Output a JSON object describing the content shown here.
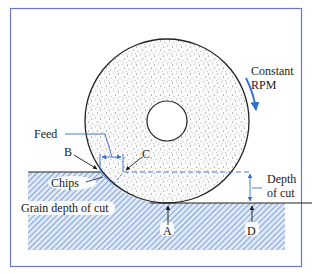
{
  "diagram": {
    "type": "grinding-process-schematic",
    "labels": {
      "rotation": "Constant",
      "rotation_line2": "RPM",
      "feed": "Feed",
      "point_b": "B",
      "point_c": "C",
      "chips": "Chips",
      "depth_of_cut": "Depth",
      "depth_of_cut_line2": "of cut",
      "grain_depth": "Grain depth of cut",
      "point_a": "A",
      "point_d": "D"
    },
    "colors": {
      "frame": "#6a78c8",
      "accent_blue": "#2f6fd0",
      "hatch": "#5b86c8",
      "workpiece_fill": "#dbe6f5",
      "chip_fill": "#9fbbe6",
      "wheel_outline": "#222222",
      "text": "#1a1a1a"
    },
    "elements": [
      "grinding-wheel",
      "wheel-hub",
      "workpiece",
      "chips",
      "feed-dimension",
      "depth-of-cut-dimension",
      "rotation-arrow"
    ]
  }
}
